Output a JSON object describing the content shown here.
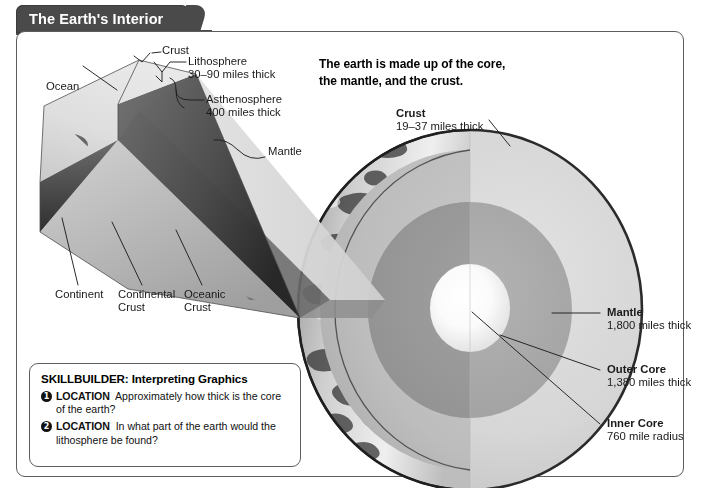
{
  "header": {
    "title": "The Earth's Interior"
  },
  "intro": {
    "text": "The earth is made up of the core,\nthe mantle, and the crust."
  },
  "wedge_labels": [
    {
      "name": "ocean",
      "title": "Ocean",
      "sub": ""
    },
    {
      "name": "crust",
      "title": "Crust",
      "sub": ""
    },
    {
      "name": "lithosphere",
      "title": "Lithosphere",
      "sub": "30–90 miles thick"
    },
    {
      "name": "asthenosphere",
      "title": "Asthenosphere",
      "sub": "400 miles thick"
    },
    {
      "name": "mantle",
      "title": "Mantle",
      "sub": ""
    },
    {
      "name": "continent",
      "title": "Continent",
      "sub": ""
    },
    {
      "name": "continental-crust",
      "title": "Continental",
      "sub": "Crust"
    },
    {
      "name": "oceanic-crust",
      "title": "Oceanic",
      "sub": "Crust"
    }
  ],
  "globe_labels": [
    {
      "name": "crust",
      "title": "Crust",
      "sub": "19–37 miles thick"
    },
    {
      "name": "mantle",
      "title": "Mantle",
      "sub": "1,800 miles thick"
    },
    {
      "name": "outer-core",
      "title": "Outer Core",
      "sub": "1,380 miles thick"
    },
    {
      "name": "inner-core",
      "title": "Inner Core",
      "sub": "760 mile radius"
    }
  ],
  "skillbuilder": {
    "heading": "SKILLBUILDER: Interpreting Graphics",
    "questions": [
      {
        "number": "1",
        "tag": "LOCATION",
        "text": "Approximately how thick is the core of the earth?"
      },
      {
        "number": "2",
        "tag": "LOCATION",
        "text": "In what part of the earth would the lithosphere be found?"
      }
    ]
  },
  "colors": {
    "tab_background": "#4a4a4a",
    "card_border": "#5d5d5d",
    "mantle": "#d4d4d4",
    "mantle_shadow": "#b9b9b9",
    "outer_core": "#a6a6a6",
    "outer_core_shadow": "#949494",
    "inner_core": "#fdfdfd",
    "globe_outline": "#2b2b2b",
    "wedge_top": "#d9d9d9",
    "wedge_side_dark": "#3a3a3a",
    "wedge_side_mid": "#6f6f6f",
    "leader_line": "#1f1f1f",
    "text": "#1a1a1a"
  }
}
